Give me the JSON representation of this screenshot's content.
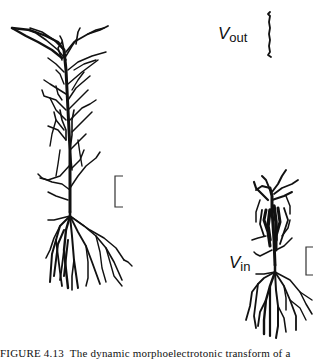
{
  "figure": {
    "labels": {
      "v_out": {
        "symbol": "V",
        "subscript": "out"
      },
      "v_in": {
        "symbol": "V",
        "subscript": "in"
      }
    },
    "scale_bars": [
      {
        "name": "left-neuron-scale-bar"
      },
      {
        "name": "right-neuron-scale-bar"
      }
    ],
    "colors": {
      "ink": "#111111",
      "scale_bar": "#333333",
      "background": "#ffffff"
    }
  },
  "caption": {
    "number": "FIGURE 4.13",
    "text": "The dynamic morphoelectrotonic transform of a"
  }
}
